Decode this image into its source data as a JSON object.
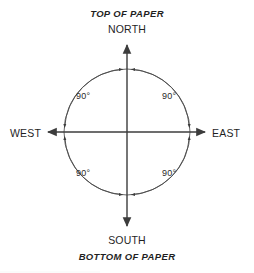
{
  "diagram": {
    "orientation_labels": {
      "top": "TOP OF PAPER",
      "bottom": "BOTTOM OF PAPER"
    },
    "cardinals": {
      "north": "NORTH",
      "south": "SOUTH",
      "east": "EAST",
      "west": "WEST"
    },
    "angles": {
      "northwest": "90°",
      "northeast": "90°",
      "southwest": "90°",
      "southeast": "90°"
    },
    "colors": {
      "background": "#ffffff",
      "line": "#3c3c3c",
      "arc": "#4a4a4a",
      "text": "#1f1f1f"
    },
    "geometry": {
      "center_x": 127,
      "center_y": 132,
      "radius": 63,
      "axis_top_y": 42,
      "axis_bottom_y": 229,
      "axis_left_x": 45,
      "axis_right_x": 208
    }
  }
}
